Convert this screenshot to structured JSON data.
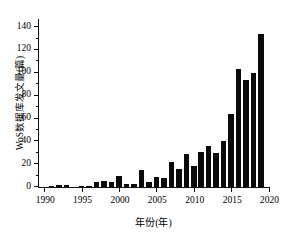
{
  "chart_data": {
    "type": "bar",
    "title": "",
    "xlabel": "年份(年)",
    "ylabel": "WoS数据库发文量(篇)",
    "xlim": [
      1989.3,
      2020.2
    ],
    "ylim": [
      0,
      148
    ],
    "grid": false,
    "legend": null,
    "yticks": [
      0,
      20,
      40,
      60,
      80,
      100,
      120,
      140
    ],
    "ytick_labels": [
      "0",
      "20",
      "40",
      "60",
      "80",
      "100",
      "120",
      "140"
    ],
    "xticks": [
      1990,
      1995,
      2000,
      2005,
      2010,
      2015,
      2020
    ],
    "xtick_labels": [
      "1990",
      "1995",
      "2000",
      "2005",
      "2010",
      "2015",
      "2020"
    ],
    "bar_color": "#0a0a0a",
    "categories": [
      1990,
      1991,
      1992,
      1993,
      1994,
      1995,
      1996,
      1997,
      1998,
      1999,
      2000,
      2001,
      2002,
      2003,
      2004,
      2005,
      2006,
      2007,
      2008,
      2009,
      2010,
      2011,
      2012,
      2013,
      2014,
      2015,
      2016,
      2017,
      2018,
      2019
    ],
    "values": [
      0,
      1,
      2,
      2,
      0,
      1,
      1,
      4,
      5,
      4,
      10,
      3,
      3,
      15,
      4,
      9,
      8,
      22,
      16,
      29,
      18,
      31,
      36,
      30,
      40,
      64,
      103,
      94,
      100,
      134
    ],
    "series": [
      {
        "name": "WoS数据库发文量(篇)",
        "values": [
          0,
          1,
          2,
          2,
          0,
          1,
          1,
          4,
          5,
          4,
          10,
          3,
          3,
          15,
          4,
          9,
          8,
          22,
          16,
          29,
          18,
          31,
          36,
          30,
          40,
          64,
          103,
          94,
          100,
          134
        ]
      }
    ]
  }
}
